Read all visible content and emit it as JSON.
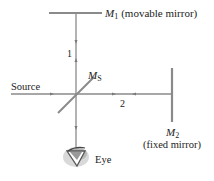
{
  "diagram": {
    "colors": {
      "line": "#8a8a8a",
      "text": "#222222",
      "eye_shadow": "#9a9a9a"
    },
    "labels": {
      "m1_symbol": "M",
      "m1_sub": "1",
      "m1_desc": "(movable mirror)",
      "ms_symbol": "M",
      "ms_sub": "S",
      "source": "Source",
      "path1": "1",
      "path2": "2",
      "m2_symbol": "M",
      "m2_sub": "2",
      "m2_desc": "(fixed mirror)",
      "eye": "Eye"
    },
    "components": [
      {
        "id": "M1",
        "role": "movable mirror"
      },
      {
        "id": "MS",
        "role": "beam splitter"
      },
      {
        "id": "M2",
        "role": "fixed mirror"
      },
      {
        "id": "source",
        "role": "light source"
      },
      {
        "id": "eye",
        "role": "observer"
      }
    ],
    "paths": [
      {
        "id": "1",
        "from": "MS",
        "to": "M1"
      },
      {
        "id": "2",
        "from": "MS",
        "to": "M2"
      }
    ]
  }
}
